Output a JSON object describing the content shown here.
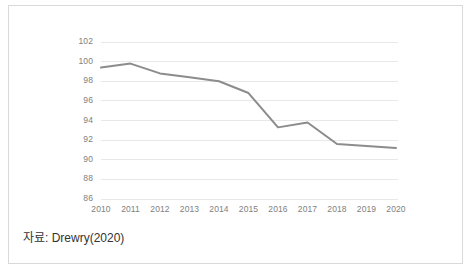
{
  "figure": {
    "caption": "자료: Drewry(2020)",
    "border_color": "#d9d9d9",
    "background_color": "#ffffff"
  },
  "chart_data": {
    "type": "line",
    "title": "",
    "subtitle": "",
    "xlabel": "",
    "ylabel": "",
    "categories": [
      "2010",
      "2011",
      "2012",
      "2013",
      "2014",
      "2015",
      "2016",
      "2017",
      "2018",
      "2019",
      "2020"
    ],
    "values": [
      99.4,
      99.8,
      98.8,
      98.4,
      98.0,
      96.8,
      93.3,
      93.8,
      91.6,
      91.4,
      91.2
    ],
    "series": [
      {
        "name": "index",
        "values": [
          99.4,
          99.8,
          98.8,
          98.4,
          98.0,
          96.8,
          93.3,
          93.8,
          91.6,
          91.4,
          91.2
        ],
        "color": "#8c8c8c"
      }
    ],
    "ylim": [
      86,
      102
    ],
    "yticks": [
      102,
      100,
      98,
      96,
      94,
      92,
      90,
      88,
      86
    ],
    "xticks": [
      "2010",
      "2011",
      "2012",
      "2013",
      "2014",
      "2015",
      "2016",
      "2017",
      "2018",
      "2019",
      "2020"
    ],
    "grid": true,
    "grid_color": "#e8e8e8",
    "legend": false,
    "legend_position": "none",
    "line_color": "#8c8c8c",
    "line_width": 2,
    "markers": false,
    "tick_label_color": "#808080"
  }
}
